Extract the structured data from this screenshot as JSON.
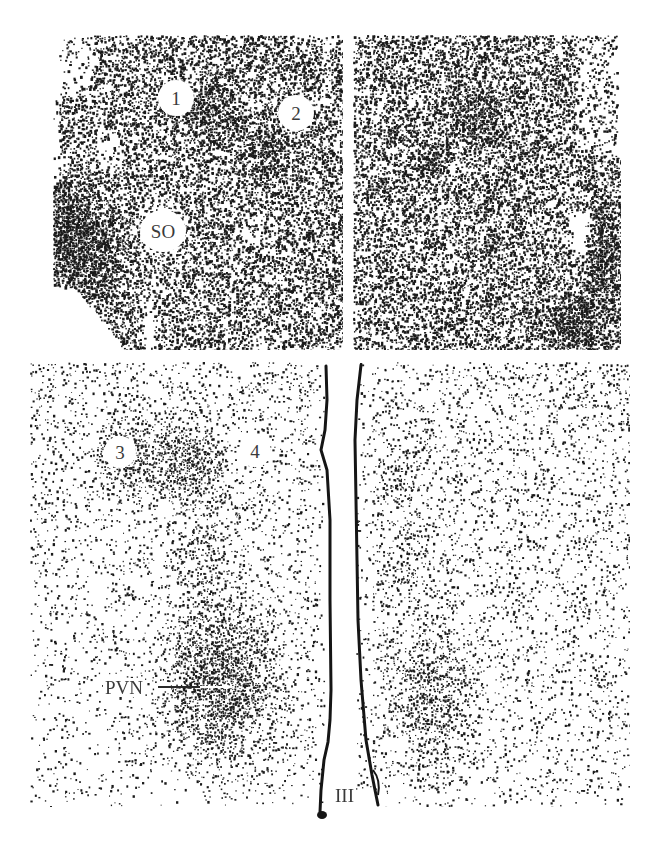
{
  "figure": {
    "colors": {
      "ink": "#1a1a1a",
      "background": "#ffffff",
      "label_text": "#3a3a3a"
    },
    "panels": [
      {
        "id": "top-left",
        "rect": [
          53,
          35,
          290,
          315
        ],
        "base_density": 0.42,
        "labels": [
          {
            "text": "1",
            "x": 176,
            "y": 98,
            "r": 18
          },
          {
            "text": "2",
            "x": 296,
            "y": 113,
            "r": 18
          },
          {
            "text": "SO",
            "x": 163,
            "y": 231,
            "r": 21
          }
        ]
      },
      {
        "id": "top-right",
        "rect": [
          353,
          35,
          268,
          315
        ],
        "base_density": 0.42,
        "labels": []
      },
      {
        "id": "bottom",
        "rect": [
          30,
          362,
          600,
          445
        ],
        "base_density": 0.08,
        "labels": [
          {
            "text": "3",
            "x": 120,
            "y": 452,
            "r": 16
          },
          {
            "text": "4",
            "x": 255,
            "y": 451,
            "r": 16
          }
        ],
        "callouts": [
          {
            "text": "PVN",
            "x": 103,
            "y": 687,
            "line": [
              150,
              686,
              220,
              686
            ]
          },
          {
            "text": "III",
            "x": 335,
            "y": 792
          }
        ]
      }
    ]
  }
}
